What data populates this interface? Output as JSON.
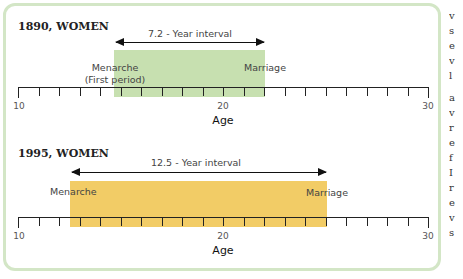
{
  "chart_data": [
    {
      "type": "timeline",
      "title": "1890, WOMEN",
      "xlabel": "Age",
      "xlim": [
        10,
        30
      ],
      "tick_labels": [
        "10",
        "20",
        "30"
      ],
      "minor_ticks_every": 1,
      "interval": {
        "start": 14.8,
        "end": 22.0,
        "color": "#c7e0b0"
      },
      "interval_label": "7.2 - Year interval",
      "events": [
        {
          "label": "Menarche\n(First period)",
          "age": 14.8
        },
        {
          "label": "Marriage",
          "age": 22.0
        }
      ]
    },
    {
      "type": "timeline",
      "title": "1995, WOMEN",
      "xlabel": "Age",
      "xlim": [
        10,
        30
      ],
      "tick_labels": [
        "10",
        "20",
        "30"
      ],
      "minor_ticks_every": 1,
      "interval": {
        "start": 12.5,
        "end": 25.0,
        "color": "#f2cc66"
      },
      "interval_label": "12.5 - Year interval",
      "events": [
        {
          "label": "Menarche",
          "age": 12.5
        },
        {
          "label": "Marriage",
          "age": 25.0
        }
      ]
    }
  ],
  "panels": [
    {
      "title": "1890, WOMEN",
      "interval_label": "7.2 - Year interval",
      "start_label_1": "Menarche",
      "start_label_2": "(First period)",
      "end_label": "Marriage",
      "axis_label": "Age",
      "ticks": {
        "t10": "10",
        "t20": "20",
        "t30": "30"
      }
    },
    {
      "title": "1995, WOMEN",
      "interval_label": "12.5 - Year interval",
      "start_label_1": "Menarche",
      "start_label_2": "",
      "end_label": "Marriage",
      "axis_label": "Age",
      "ticks": {
        "t10": "10",
        "t20": "20",
        "t30": "30"
      }
    }
  ]
}
